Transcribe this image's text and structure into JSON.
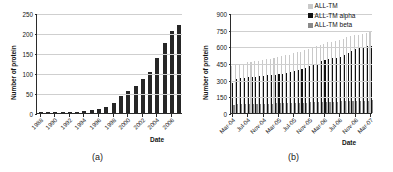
{
  "figure": {
    "panels": [
      {
        "caption": "(a)",
        "ylabel": "Number of protein",
        "xlabel": "Date",
        "legend": []
      },
      {
        "caption": "(b)",
        "ylabel": "Number of protein",
        "xlabel": "Date",
        "legend": [
          "ALL-TM",
          "ALL-TM alpha",
          "ALL-TM beta"
        ]
      }
    ]
  },
  "chart_data": [
    {
      "type": "bar",
      "panel": "(a)",
      "title": "",
      "xlabel": "Date",
      "ylabel": "Number of protein",
      "ylim": [
        0,
        250
      ],
      "yticks": [
        0,
        50,
        100,
        150,
        200,
        250
      ],
      "grid": true,
      "legend_position": "none",
      "tick_labels": [
        "1988",
        "1990",
        "1992",
        "1994",
        "1996",
        "1998",
        "2000",
        "2002",
        "2004",
        "2006"
      ],
      "categories": [
        "1988",
        "1989",
        "1990",
        "1991",
        "1992",
        "1993",
        "1994",
        "1995",
        "1996",
        "1997",
        "1998",
        "1999",
        "2000",
        "2001",
        "2002",
        "2003",
        "2004",
        "2005",
        "2006",
        "2007"
      ],
      "values": [
        1,
        1,
        1,
        2,
        2,
        3,
        4,
        7,
        10,
        15,
        24,
        42,
        54,
        68,
        85,
        103,
        138,
        175,
        206,
        220
      ],
      "series_name": "Number of protein"
    },
    {
      "type": "bar",
      "panel": "(b)",
      "title": "",
      "xlabel": "Date",
      "ylabel": "Number of protein",
      "ylim": [
        0,
        900
      ],
      "yticks": [
        0,
        150,
        300,
        450,
        600,
        750,
        900
      ],
      "grid": true,
      "legend_position": "top-right",
      "tick_labels": [
        "Mar-04",
        "Jul-04",
        "Nov-04",
        "Mar-05",
        "Jul-05",
        "Nov-05",
        "Mar-06",
        "Jul-06",
        "Nov-06",
        "Mar-07"
      ],
      "categories": [
        "Mar-04",
        "Apr-04",
        "May-04",
        "Jun-04",
        "Jul-04",
        "Aug-04",
        "Sep-04",
        "Oct-04",
        "Nov-04",
        "Dec-04",
        "Jan-05",
        "Feb-05",
        "Mar-05",
        "Apr-05",
        "May-05",
        "Jun-05",
        "Jul-05",
        "Aug-05",
        "Sep-05",
        "Oct-05",
        "Nov-05",
        "Dec-05",
        "Jan-06",
        "Feb-06",
        "Mar-06",
        "Apr-06",
        "May-06",
        "Jun-06",
        "Jul-06",
        "Aug-06",
        "Sep-06",
        "Oct-06",
        "Nov-06",
        "Dec-06",
        "Jan-07",
        "Feb-07",
        "Mar-07"
      ],
      "series": [
        {
          "name": "ALL-TM",
          "color": "#c9c9c9",
          "values": [
            420,
            430,
            440,
            445,
            455,
            460,
            465,
            470,
            480,
            485,
            490,
            495,
            500,
            510,
            520,
            525,
            540,
            545,
            550,
            565,
            580,
            590,
            600,
            610,
            625,
            635,
            640,
            650,
            660,
            665,
            680,
            690,
            700,
            705,
            715,
            720,
            730
          ]
        },
        {
          "name": "ALL-TM alpha",
          "color": "#111111",
          "values": [
            270,
            310,
            315,
            318,
            322,
            325,
            328,
            330,
            335,
            338,
            340,
            345,
            350,
            355,
            360,
            365,
            375,
            385,
            395,
            405,
            420,
            435,
            445,
            465,
            480,
            490,
            492,
            495,
            505,
            520,
            540,
            555,
            575,
            585,
            595,
            600,
            605
          ]
        },
        {
          "name": "ALL-TM beta",
          "color": "#8a8a8a",
          "values": [
            68,
            80,
            80,
            80,
            80,
            82,
            82,
            82,
            85,
            85,
            85,
            88,
            88,
            88,
            88,
            90,
            90,
            90,
            92,
            92,
            95,
            95,
            98,
            100,
            100,
            100,
            100,
            100,
            105,
            105,
            108,
            108,
            110,
            110,
            112,
            112,
            115
          ]
        }
      ]
    }
  ]
}
